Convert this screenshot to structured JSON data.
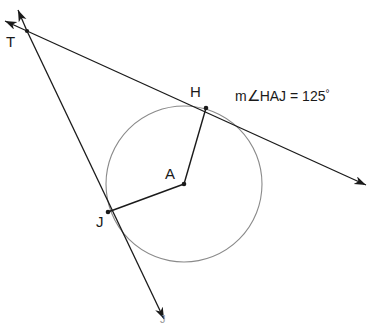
{
  "figure": {
    "type": "geometry-diagram",
    "width": 379,
    "height": 327,
    "background_color": "#ffffff",
    "stroke_color": "#1a1a1a",
    "circle_stroke_color": "#8a8a8a",
    "points": [
      {
        "id": "T",
        "label": "T",
        "x": 27,
        "y": 31,
        "label_x": 6,
        "label_y": 34,
        "dot": true
      },
      {
        "id": "H",
        "label": "H",
        "x": 206,
        "y": 108,
        "label_x": 190,
        "label_y": 84,
        "dot": true
      },
      {
        "id": "A",
        "label": "A",
        "x": 184,
        "y": 184,
        "label_x": 165,
        "label_y": 166,
        "dot": true
      },
      {
        "id": "J",
        "label": "J",
        "x": 108,
        "y": 212,
        "label_x": 96,
        "label_y": 214,
        "dot": true
      }
    ],
    "circle": {
      "center_id": "A",
      "cx": 184,
      "cy": 184,
      "r": 78
    },
    "segments": [
      {
        "id": "radius-AH",
        "from": "A",
        "to": "H"
      },
      {
        "id": "radius-AJ",
        "from": "A",
        "to": "J"
      }
    ],
    "rays": [
      {
        "id": "tangent-ray-TH",
        "through": [
          "T",
          "H"
        ],
        "start_x": 27,
        "start_y": 31,
        "end_x": 368,
        "end_y": 186,
        "back_x": 2,
        "back_y": 20,
        "arrow_forward": true,
        "arrow_backward": true
      },
      {
        "id": "tangent-ray-TJ",
        "through": [
          "T",
          "J"
        ],
        "start_x": 27,
        "start_y": 31,
        "end_x": 165,
        "end_y": 322,
        "back_x": 16,
        "back_y": 8,
        "arrow_forward": true,
        "arrow_backward": true
      }
    ],
    "annotations": [
      {
        "id": "angle-measure-HAJ",
        "prefix": "m",
        "angle_symbol": "∠",
        "vertices": "HAJ",
        "equals": " = ",
        "value": "125",
        "unit": "°",
        "full_text": "m∠HAJ = 125°",
        "x": 235,
        "y": 88
      }
    ],
    "faint_marks": [
      {
        "id": "faint-top-artifact",
        "text": "",
        "x": 120,
        "y": 1
      },
      {
        "id": "faint-bottom-label",
        "text": "J",
        "x": 160,
        "y": 313
      }
    ]
  }
}
